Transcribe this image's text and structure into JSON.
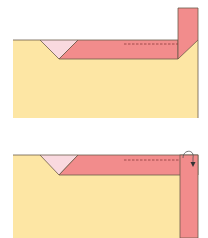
{
  "diagram": {
    "colors": {
      "paper": "#fde6a4",
      "band": "#f28c8c",
      "triangle": "#f9d9df",
      "outline": "#6b5a4a",
      "dash": "#8a3b3b",
      "background": "#ffffff"
    },
    "steps": [
      {
        "id": "step-1",
        "description": "Strip raised vertically at right edge"
      },
      {
        "id": "step-2",
        "description": "Strip folded down along right edge (arrow shows fold direction)",
        "arrow": "curved-fold-down-arrow"
      }
    ]
  }
}
